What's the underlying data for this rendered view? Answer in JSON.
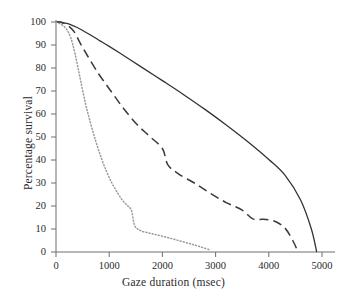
{
  "chart_data": {
    "type": "line",
    "title": "",
    "subtitle": "",
    "xlabel": "Gaze duration (msec)",
    "ylabel": "Percentage survival",
    "xlim": [
      0,
      5000
    ],
    "ylim": [
      0,
      100
    ],
    "xticks": [
      0,
      1000,
      2000,
      3000,
      4000,
      5000
    ],
    "xtick_labels": [
      "0",
      "1000",
      "2000",
      "3000",
      "4000",
      "5000"
    ],
    "yticks": [
      0,
      10,
      20,
      30,
      40,
      50,
      60,
      70,
      80,
      90,
      100
    ],
    "ytick_labels": [
      "0",
      "10",
      "20",
      "30",
      "40",
      "50",
      "60",
      "70",
      "80",
      "90",
      "100"
    ],
    "grid": false,
    "legend": "none",
    "series": [
      {
        "name": "solid-curve",
        "style": "solid",
        "color": "#333333",
        "x": [
          0,
          60,
          150,
          260,
          400,
          600,
          800,
          1000,
          1300,
          1600,
          2000,
          2400,
          2800,
          3200,
          3600,
          4000,
          4300,
          4600,
          4800,
          4900
        ],
        "values": [
          100,
          100,
          99.6,
          99,
          97.6,
          95,
          92.2,
          89.4,
          85,
          80.5,
          74.5,
          68.4,
          62,
          55.2,
          48,
          40.2,
          33.5,
          22.5,
          10.0,
          0
        ]
      },
      {
        "name": "dashed-curve",
        "style": "dashed",
        "color": "#3a3a3a",
        "x": [
          0,
          60,
          150,
          250,
          350,
          450,
          600,
          800,
          1000,
          1250,
          1500,
          1750,
          2000,
          2100,
          2300,
          2600,
          2900,
          3200,
          3500,
          3700,
          3900,
          4100,
          4300,
          4450,
          4550
        ],
        "values": [
          100,
          100,
          99.4,
          98,
          95.5,
          91,
          85,
          77.5,
          71,
          63,
          56,
          50.5,
          45,
          38,
          34,
          30,
          25.5,
          21.5,
          18.2,
          14.4,
          14.2,
          13.5,
          10.5,
          5.0,
          0
        ]
      },
      {
        "name": "dotted-curve",
        "style": "dotted",
        "color": "#9a9a9a",
        "x": [
          0,
          50,
          120,
          200,
          280,
          360,
          450,
          550,
          650,
          750,
          850,
          950,
          1050,
          1150,
          1250,
          1350,
          1420,
          1480,
          1600,
          1800,
          2050,
          2300,
          2550,
          2750,
          2880
        ],
        "values": [
          100,
          99.5,
          98.6,
          96.8,
          93,
          86,
          76,
          65,
          56,
          48,
          41,
          35,
          30,
          26,
          22.5,
          20,
          18,
          11.5,
          9.2,
          8.0,
          6.6,
          5.0,
          3.4,
          2.0,
          1.0
        ]
      }
    ]
  },
  "axes": {
    "x_title": "Gaze duration (msec)",
    "y_title": "Percentage survival"
  }
}
